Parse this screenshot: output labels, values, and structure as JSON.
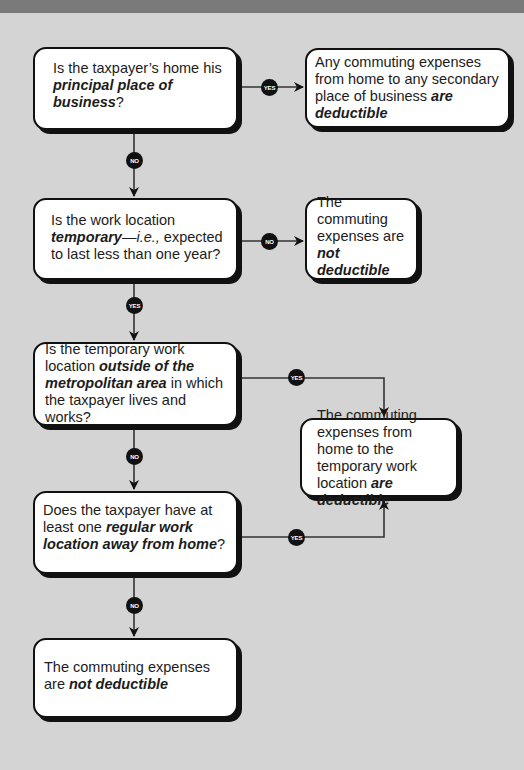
{
  "flowchart": {
    "q1": {
      "pre": "Is the taxpayer’s home his ",
      "emph": "principal place of business",
      "post": "?"
    },
    "r1": {
      "pre": "Any commuting expenses from home to any secondary place of business ",
      "emph": "are deductible"
    },
    "q2": {
      "pre": "Is the work location ",
      "emph": "temporary",
      "dash": "—",
      "ital": "i.e.,",
      "post": " expected to last less than one year?"
    },
    "r2": {
      "pre": "The commuting expenses are ",
      "emph": "not deductible"
    },
    "q3": {
      "pre": "Is the temporary work location ",
      "emph": "outside of the metropolitan area",
      "post": " in which the taxpayer lives and works?"
    },
    "r3": {
      "pre": "The commuting expenses from home to the temporary work location ",
      "emph": "are deductible"
    },
    "q4": {
      "pre": "Does the taxpayer have at least one ",
      "emph": "regular work location away from home",
      "post": "?"
    },
    "r4": {
      "pre": "The commuting expenses are ",
      "emph": "not deductible"
    },
    "badges": {
      "yes": "YES",
      "no": "NO"
    }
  },
  "colors": {
    "background": "#d4d4d4",
    "box": "#ffffff",
    "line": "#111111",
    "topbar": "#7a7a7a"
  }
}
